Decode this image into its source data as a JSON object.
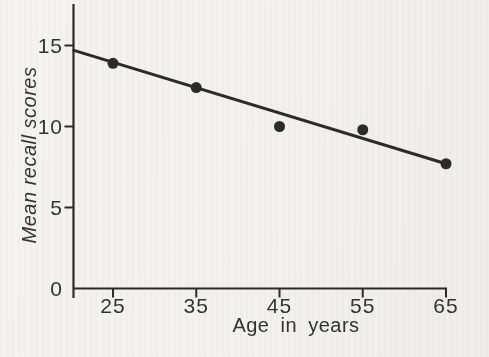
{
  "figure": {
    "background": "#f2f1ee",
    "ink": "#2b2b2b",
    "text_color": "#333333"
  },
  "chart_data": {
    "type": "scatter",
    "title": "",
    "xlabel": "Age in years",
    "ylabel": "Mean recall scores",
    "x": [
      25,
      35,
      45,
      55,
      65
    ],
    "y": [
      13.9,
      12.4,
      10.0,
      9.8,
      7.7
    ],
    "series": [
      {
        "name": "Mean recall scores",
        "x": [
          25,
          35,
          45,
          55,
          65
        ],
        "values": [
          13.9,
          12.4,
          10.0,
          9.8,
          7.7
        ]
      }
    ],
    "x_ticks": [
      25,
      35,
      45,
      55,
      65
    ],
    "y_ticks": [
      0,
      5,
      10,
      15
    ],
    "xlim": [
      20.3,
      65
    ],
    "ylim": [
      0,
      17.6
    ],
    "grid": false,
    "legend": false,
    "fit_line": {
      "x1": 20.3,
      "y1": 14.7,
      "x2": 65,
      "y2": 7.7
    }
  }
}
